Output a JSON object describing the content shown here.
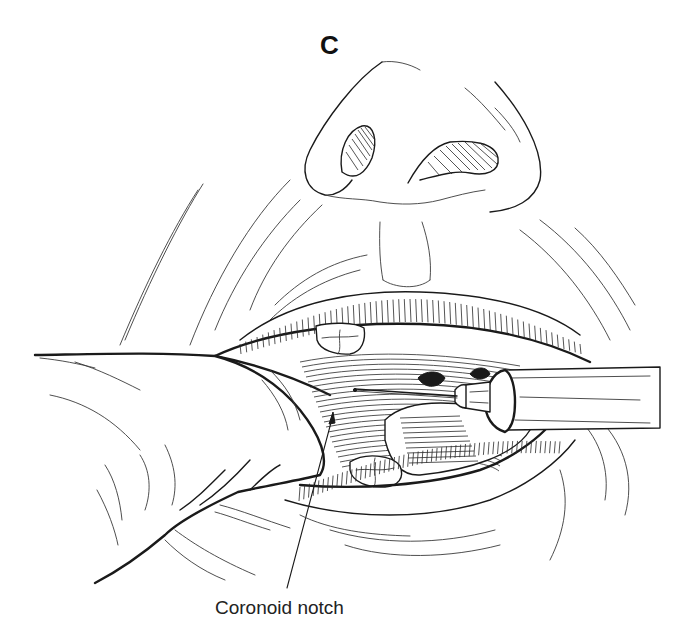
{
  "figure": {
    "panel_letter": "C",
    "labels": [
      {
        "id": "coronoid-notch",
        "text": "Coronoid notch"
      }
    ],
    "depicted": {
      "subject": "intraoral injection at the coronoid notch",
      "elements": [
        "nose",
        "nostrils",
        "upper-lip",
        "lower-lip",
        "upper-tooth",
        "lower-tooth",
        "retracting-finger",
        "syringe",
        "needle",
        "buccal-mucosa"
      ]
    }
  }
}
